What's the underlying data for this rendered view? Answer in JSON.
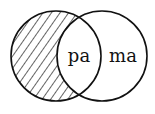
{
  "diagram": {
    "type": "venn",
    "sets": [
      {
        "id": "left",
        "cx": 56,
        "cy": 56,
        "r": 45,
        "hatched": true
      },
      {
        "id": "right",
        "cx": 102,
        "cy": 56,
        "r": 45,
        "hatched": false
      }
    ],
    "regions": {
      "intersection": {
        "label": "pa"
      },
      "right_only": {
        "label": "ma"
      },
      "left_only": {
        "label": "",
        "shading": "diagonal-hatch"
      }
    },
    "colors": {
      "stroke": "#111111",
      "background": "#ffffff"
    }
  }
}
